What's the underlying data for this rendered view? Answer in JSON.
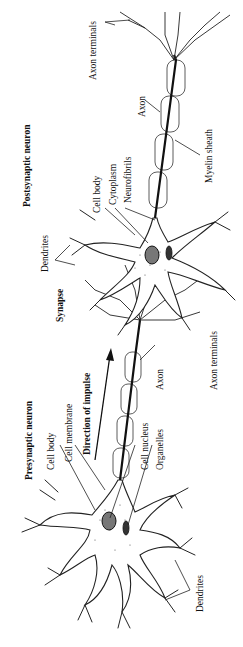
{
  "diagram": {
    "orientation": "rotated-90-ccw",
    "neurons": [
      {
        "id": "presynaptic",
        "title": "Presynaptic neuron",
        "labels": [
          "Cell body",
          "Cell membrane",
          "Cell nucleus",
          "Organelles",
          "Dendrites",
          "Axon",
          "Axon terminals"
        ]
      },
      {
        "id": "postsynaptic",
        "title": "Postsynaptic neuron",
        "labels": [
          "Cell body",
          "Cytoplasm",
          "Neurofibrils",
          "Dendrites",
          "Axon",
          "Myelin sheath",
          "Axon terminals"
        ]
      }
    ],
    "arrow_label": "Direction of impulse",
    "junction_label": "Synapse"
  },
  "labels": {
    "pre_title": "Presynaptic neuron",
    "pre_cell_body": "Cell body",
    "pre_cell_membrane": "Cell membrane",
    "pre_cell_nucleus": "Cell nucleus",
    "pre_organelles": "Organelles",
    "pre_dendrites": "Dendrites",
    "pre_axon": "Axon",
    "pre_axon_terminals": "Axon terminals",
    "direction": "Direction of impulse",
    "synapse": "Synapse",
    "post_title": "Postsynaptic neuron",
    "post_cell_body": "Cell body",
    "post_cytoplasm": "Cytoplasm",
    "post_neurofibrils": "Neurofibrils",
    "post_dendrites": "Dendrites",
    "post_axon": "Axon",
    "post_myelin": "Myelin sheath",
    "post_axon_terminals": "Axon terminals"
  }
}
